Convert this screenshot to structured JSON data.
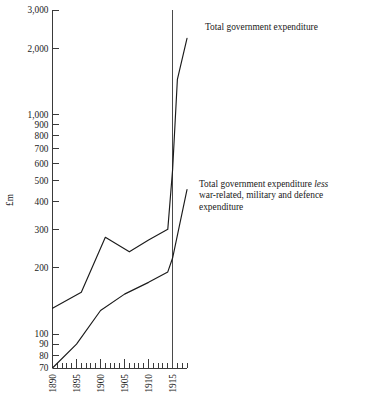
{
  "chart_data": {
    "type": "line",
    "title": "",
    "xlabel": "",
    "ylabel": "£m",
    "yscale": "log",
    "ylim": [
      70,
      3000
    ],
    "xlim": [
      1890,
      1918
    ],
    "grid": false,
    "legend_position": "inline-annotations",
    "y_tick_labels": [
      "3,000",
      "2,000",
      "1,000",
      "900",
      "800",
      "700",
      "600",
      "500",
      "400",
      "300",
      "200",
      "100",
      "90",
      "80",
      "70"
    ],
    "y_tick_values": [
      3000,
      2000,
      1000,
      900,
      800,
      700,
      600,
      500,
      400,
      300,
      200,
      100,
      90,
      80,
      70
    ],
    "x_tick_labels": [
      "1890",
      "1895",
      "1900",
      "1905",
      "1910",
      "1915"
    ],
    "x_tick_values": [
      1890,
      1895,
      1900,
      1905,
      1910,
      1915
    ],
    "x_minor_tick_interval": 1,
    "reference_line": {
      "x": 1915,
      "label": ""
    },
    "series": [
      {
        "name": "Total government expenditure",
        "x": [
          1890,
          1896,
          1901,
          1906,
          1910,
          1914,
          1915,
          1916,
          1918
        ],
        "values": [
          131,
          155,
          276,
          237,
          268,
          300,
          560,
          1450,
          2230
        ]
      },
      {
        "name": "Total government expenditure less war-related, military and defence expenditure",
        "x": [
          1890,
          1895,
          1900,
          1905,
          1910,
          1914,
          1915,
          1918
        ],
        "values": [
          70,
          90,
          128,
          152,
          172,
          192,
          222,
          455
        ]
      }
    ],
    "annotations": [
      {
        "id": "total",
        "lines": [
          {
            "text": "Total government expenditure",
            "style": "normal"
          }
        ]
      },
      {
        "id": "less",
        "lines": [
          {
            "text": "Total government expenditure ",
            "style": "normal"
          },
          {
            "text": "less",
            "style": "italic"
          },
          {
            "text": "\nwar-related, military and defence\nexpenditure",
            "style": "normal"
          }
        ]
      }
    ]
  },
  "annotations": {
    "total_label": "Total government expenditure",
    "less_prefix": "Total government expenditure ",
    "less_italic": "less",
    "less_rest": "war-related, military and defence expenditure"
  },
  "axis": {
    "y_title": "£m"
  }
}
